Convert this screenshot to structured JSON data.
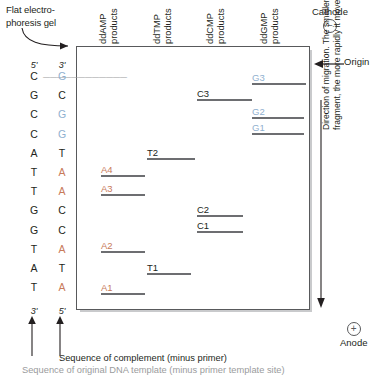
{
  "figure": {
    "callout_line1": "Flat electro-",
    "callout_line2": "phoresis gel",
    "sequence_caption": "Sequence of complement (minus primer)",
    "footnote": "Sequence of original DNA template (minus primer template site)"
  },
  "columns": [
    {
      "name": "ddAMP",
      "line1": "ddAMP",
      "line2": "products"
    },
    {
      "name": "ddTMP",
      "line1": "ddTMP",
      "line2": "products"
    },
    {
      "name": "ddCMP",
      "line1": "ddCMP",
      "line2": "products"
    },
    {
      "name": "ddGMP",
      "line1": "ddGMP",
      "line2": "products"
    }
  ],
  "template_strand": {
    "top_label": "5'",
    "bottom_label": "3'",
    "residues": [
      "C",
      "G",
      "C",
      "C",
      "A",
      "T",
      "T",
      "G",
      "G",
      "T",
      "A",
      "T"
    ]
  },
  "complement_strand": {
    "top_label": "3'",
    "bottom_label": "5'",
    "residues": [
      "G",
      "C",
      "G",
      "G",
      "T",
      "A",
      "A",
      "C",
      "C",
      "A",
      "T",
      "A"
    ],
    "residue_colors": [
      "G",
      "C",
      "G",
      "G",
      "T",
      "A",
      "A",
      "C",
      "C",
      "A",
      "T",
      "A"
    ]
  },
  "bands": [
    {
      "label": "G3",
      "lane": "ddGMP",
      "kind": "G"
    },
    {
      "label": "C3",
      "lane": "ddCMP",
      "kind": "plain"
    },
    {
      "label": "G2",
      "lane": "ddGMP",
      "kind": "G"
    },
    {
      "label": "G1",
      "lane": "ddGMP",
      "kind": "G"
    },
    {
      "label": "T2",
      "lane": "ddTMP",
      "kind": "plain"
    },
    {
      "label": "A4",
      "lane": "ddAMP",
      "kind": "A"
    },
    {
      "label": "A3",
      "lane": "ddAMP",
      "kind": "A"
    },
    {
      "label": "C2",
      "lane": "ddCMP",
      "kind": "plain"
    },
    {
      "label": "C1",
      "lane": "ddCMP",
      "kind": "plain"
    },
    {
      "label": "A2",
      "lane": "ddAMP",
      "kind": "A"
    },
    {
      "label": "T1",
      "lane": "ddTMP",
      "kind": "plain"
    },
    {
      "label": "A1",
      "lane": "ddAMP",
      "kind": "A"
    }
  ],
  "annotations": {
    "cathode": "Cathode",
    "cathode_sign": "−",
    "anode": "Anode",
    "anode_sign": "+",
    "origin": "Origin",
    "migration_line1": "Direction of migration. The smaller a",
    "migration_line2": "fragment, the more rapidly it moves."
  },
  "colors": {
    "adenine": "#c87a5a",
    "guanine": "#8fb0cf",
    "plain": "#231f20",
    "band": "#6d6e71",
    "box": "#58595b"
  }
}
